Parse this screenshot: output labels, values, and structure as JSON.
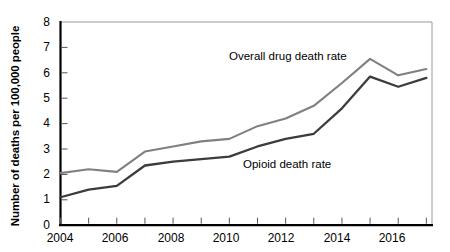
{
  "chart_data": {
    "type": "line",
    "title": "",
    "xlabel": "",
    "ylabel": "Number of deaths per 100,000 people",
    "x": [
      2004,
      2005,
      2006,
      2007,
      2008,
      2009,
      2010,
      2011,
      2012,
      2013,
      2014,
      2015,
      2016,
      2017
    ],
    "xlim": [
      2004,
      2017.2
    ],
    "ylim": [
      0,
      8
    ],
    "y_ticks": [
      0,
      1,
      2,
      3,
      4,
      5,
      6,
      7,
      8
    ],
    "y_tick_labels": [
      "0",
      "1",
      "2",
      "3",
      "4",
      "5",
      "6",
      "7",
      "8"
    ],
    "x_ticks": [
      2004,
      2005,
      2006,
      2007,
      2008,
      2009,
      2010,
      2011,
      2012,
      2013,
      2014,
      2015,
      2016,
      2017
    ],
    "x_tick_labels_shown": [
      "2004",
      "2006",
      "2008",
      "2010",
      "2012",
      "2014",
      "2016"
    ],
    "x_tick_labels_shown_values": [
      2004,
      2006,
      2008,
      2010,
      2012,
      2014,
      2016
    ],
    "grid": false,
    "legend_position": "inline-annotation",
    "series": [
      {
        "name": "Overall drug death rate",
        "color": "#808080",
        "values": [
          2.05,
          2.2,
          2.1,
          2.9,
          3.1,
          3.3,
          3.4,
          3.9,
          4.2,
          4.7,
          5.6,
          6.55,
          5.9,
          6.15
        ]
      },
      {
        "name": "Opioid death rate",
        "color": "#3c3c3c",
        "values": [
          1.1,
          1.4,
          1.55,
          2.35,
          2.5,
          2.6,
          2.7,
          3.1,
          3.4,
          3.6,
          4.6,
          5.85,
          5.45,
          5.8
        ]
      }
    ],
    "annotations": [
      {
        "text": "Overall drug death rate",
        "series": "Overall drug death rate"
      },
      {
        "text": "Opioid death rate",
        "series": "Opioid death rate"
      }
    ]
  },
  "axis_colors": {
    "spine": "#000000",
    "frame": "#9a9a9a",
    "tick": "#000000"
  }
}
